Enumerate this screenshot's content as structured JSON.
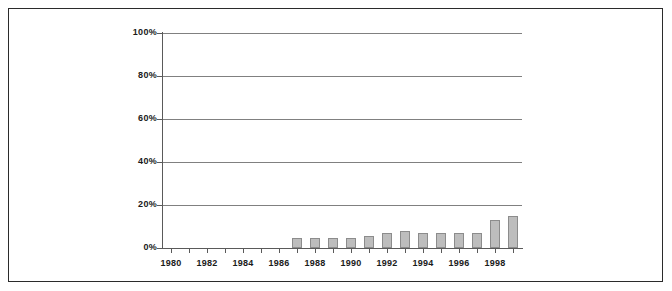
{
  "chart_data": {
    "type": "bar",
    "title": "",
    "subtitle": "",
    "xlabel": "",
    "ylabel": "",
    "categories": [
      "1980",
      "1981",
      "1982",
      "1983",
      "1984",
      "1985",
      "1986",
      "1987",
      "1988",
      "1989",
      "1990",
      "1991",
      "1992",
      "1993",
      "1994",
      "1995",
      "1996",
      "1997",
      "1998",
      "1999"
    ],
    "values": [
      0,
      0,
      0,
      0,
      0,
      0,
      0,
      4.5,
      4.5,
      4.5,
      4.5,
      5.5,
      7,
      8,
      7,
      7,
      7,
      7,
      13,
      15
    ],
    "tick_labels_x": [
      "1980",
      "1982",
      "1984",
      "1986",
      "1988",
      "1990",
      "1992",
      "1994",
      "1996",
      "1998"
    ],
    "tick_labels_y": [
      "0%",
      "20%",
      "40%",
      "60%",
      "80%",
      "100%"
    ],
    "tick_values_y": [
      0,
      20,
      40,
      60,
      80,
      100
    ],
    "ylim": [
      0,
      100
    ],
    "grid": "horizontal",
    "legend": "none",
    "bar_color": "#bdbdbd",
    "bar_border_color": "#8c8c8c",
    "gridline_color": "#808080",
    "axis_color": "#5a5a5a",
    "frame_color": "#2b2b2b",
    "background_color": "#ffffff",
    "value_unit": "%"
  }
}
